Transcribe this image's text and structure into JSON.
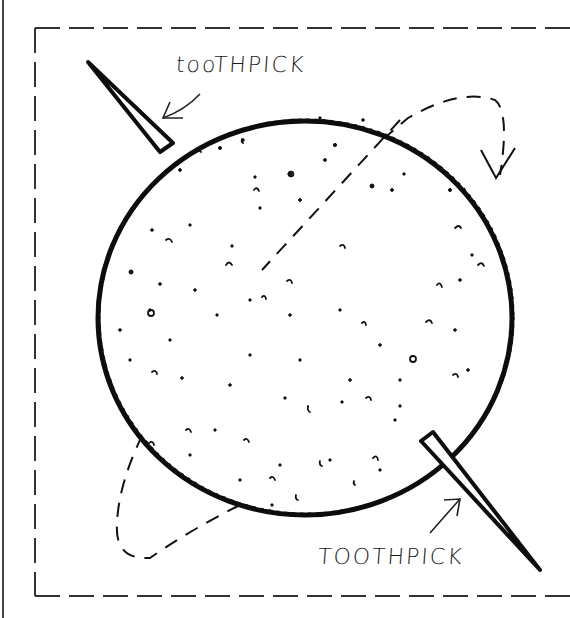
{
  "illustration": {
    "subject": "round cracker skewered with two toothpicks, rotation arrows",
    "labels": {
      "top": "tooTHPICK",
      "bottom": "TOOTHPICK"
    },
    "colors": {
      "ink": "#111111",
      "background": "#ffffff",
      "frame": "#333333"
    }
  }
}
